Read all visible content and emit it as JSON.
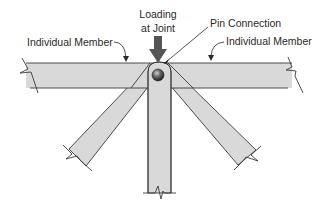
{
  "diagram": {
    "labels": {
      "loading_line1": "Loading",
      "loading_line2": "at Joint",
      "pin_connection": "Pin Connection",
      "member_left": "Individual Member",
      "member_right": "Individual Member"
    },
    "colors": {
      "member_fill": "#d9d9d9",
      "outline": "#3a3a3a",
      "arrow": "#555555",
      "pin": "#333333",
      "background": "#ffffff"
    },
    "elements": [
      {
        "name": "horizontal-member",
        "kind": "member",
        "orientation": "horizontal",
        "ends": "broken both sides"
      },
      {
        "name": "vertical-member",
        "kind": "member",
        "orientation": "vertical",
        "ends": "broken bottom"
      },
      {
        "name": "left-diagonal-member",
        "kind": "member",
        "orientation": "diagonal down-left",
        "ends": "broken"
      },
      {
        "name": "right-diagonal-member",
        "kind": "member",
        "orientation": "diagonal down-right",
        "ends": "broken"
      },
      {
        "name": "pin",
        "kind": "connector"
      },
      {
        "name": "load-arrow",
        "kind": "force",
        "direction": "down"
      }
    ]
  }
}
